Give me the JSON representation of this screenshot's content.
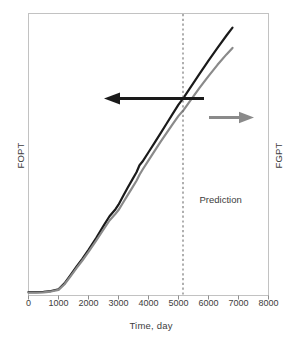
{
  "figure": {
    "background": "#ffffff",
    "frame_color": "#bfbfbf"
  },
  "chart_data": {
    "type": "line",
    "title": "",
    "xlabel": "Time, day",
    "ylabel": "FOPT",
    "ylabel_right": "FGPT",
    "xlim": [
      0,
      8000
    ],
    "ylim": [
      0,
      1
    ],
    "grid": false,
    "legend": "none",
    "xticks": [
      0,
      1000,
      2000,
      3000,
      4000,
      5000,
      6000,
      7000,
      8000
    ],
    "xtick_labels": [
      "0",
      "1000",
      "2000",
      "3000",
      "4000",
      "5000",
      "6000",
      "7000",
      "8000"
    ],
    "yticks": [],
    "ytick_labels": [],
    "series": [
      {
        "name": "FOPT",
        "axis": "left",
        "color": "#1a1a1a",
        "width": 2.2,
        "x": [
          0,
          250,
          500,
          750,
          1000,
          1200,
          1400,
          1600,
          1800,
          2000,
          2250,
          2500,
          2700,
          2900,
          3000,
          3150,
          3300,
          3450,
          3600,
          3700,
          3800,
          4000,
          4200,
          4400,
          4600,
          4800,
          5000,
          5150,
          5400,
          5700,
          6000,
          6300,
          6600,
          6800
        ],
        "y": [
          0.012,
          0.012,
          0.013,
          0.016,
          0.022,
          0.043,
          0.072,
          0.102,
          0.131,
          0.162,
          0.203,
          0.247,
          0.281,
          0.306,
          0.322,
          0.352,
          0.381,
          0.409,
          0.437,
          0.462,
          0.475,
          0.508,
          0.541,
          0.575,
          0.609,
          0.643,
          0.677,
          0.698,
          0.738,
          0.786,
          0.833,
          0.878,
          0.922,
          0.95
        ]
      },
      {
        "name": "FGPT",
        "axis": "right",
        "color": "#8a8a8a",
        "width": 2.2,
        "x": [
          0,
          250,
          500,
          750,
          1000,
          1200,
          1400,
          1600,
          1800,
          2000,
          2250,
          2500,
          2700,
          2900,
          3000,
          3150,
          3300,
          3450,
          3600,
          3700,
          3800,
          4000,
          4200,
          4400,
          4600,
          4800,
          5000,
          5150,
          5400,
          5700,
          6000,
          6300,
          6600,
          6800
        ],
        "y": [
          0.01,
          0.01,
          0.011,
          0.014,
          0.02,
          0.04,
          0.068,
          0.097,
          0.125,
          0.155,
          0.194,
          0.234,
          0.266,
          0.29,
          0.303,
          0.329,
          0.355,
          0.381,
          0.407,
          0.428,
          0.446,
          0.479,
          0.512,
          0.545,
          0.576,
          0.607,
          0.637,
          0.655,
          0.692,
          0.736,
          0.778,
          0.818,
          0.855,
          0.878
        ]
      }
    ],
    "annotations": [
      {
        "name": "prediction-divider",
        "kind": "vline",
        "x": 5150,
        "style": "dashed",
        "color": "#6e6e6e"
      },
      {
        "name": "prediction-label",
        "kind": "text",
        "text": "Prediction",
        "x": 5700,
        "y": 0.34
      },
      {
        "name": "left-axis-arrow",
        "kind": "arrow",
        "direction": "left",
        "color": "#1a1a1a",
        "points_to": "FOPT"
      },
      {
        "name": "right-axis-arrow",
        "kind": "arrow",
        "direction": "right",
        "color": "#8a8a8a",
        "points_to": "FGPT"
      }
    ]
  }
}
